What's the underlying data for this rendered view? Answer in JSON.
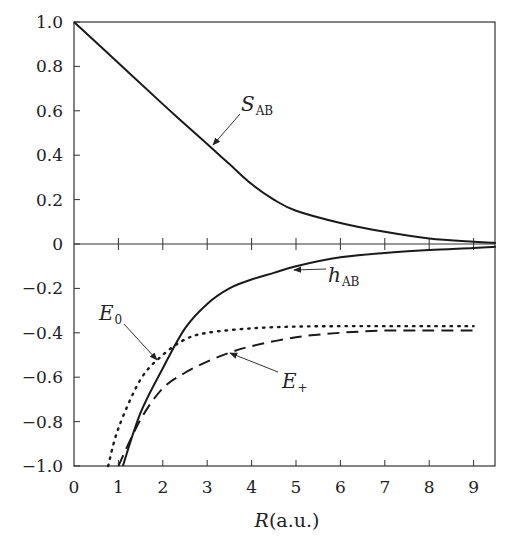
{
  "chart_data": {
    "type": "line",
    "title": "",
    "xlabel": "R(a.u.)",
    "xlabel_italic_part": "R",
    "xlabel_unit_part": "(a.u.)",
    "ylabel": "",
    "xlim": [
      0,
      9.5
    ],
    "ylim": [
      -1.0,
      1.0
    ],
    "grid": false,
    "legend": "inline labels with arrows",
    "x_ticks": [
      0,
      1,
      2,
      3,
      4,
      5,
      6,
      7,
      8,
      9
    ],
    "x_tick_labels": [
      "0",
      "1",
      "2",
      "3",
      "4",
      "5",
      "6",
      "7",
      "8",
      "9"
    ],
    "y_ticks": [
      1.0,
      0.8,
      0.6,
      0.4,
      0.2,
      0,
      -0.2,
      -0.4,
      -0.6,
      -0.8,
      -1.0
    ],
    "y_tick_labels": [
      "1.0",
      "0.8",
      "0.6",
      "0.4",
      "0.2",
      "0",
      "−0.2",
      "−0.4",
      "−0.6",
      "−0.8",
      "−1.0"
    ],
    "zero_line": true,
    "series": [
      {
        "name": "S_AB",
        "label_main": "S",
        "label_sub": "AB",
        "style": "solid",
        "x": [
          0,
          1,
          2,
          3,
          3.5,
          4,
          4.5,
          5,
          6,
          7,
          8,
          9,
          9.5
        ],
        "y": [
          1.0,
          0.815,
          0.63,
          0.45,
          0.36,
          0.27,
          0.2,
          0.15,
          0.095,
          0.055,
          0.025,
          0.01,
          0.005
        ]
      },
      {
        "name": "h_AB",
        "label_main": "h",
        "label_sub": "AB",
        "style": "solid",
        "x": [
          1.1,
          1.5,
          2,
          2.5,
          3,
          3.5,
          4,
          4.5,
          5,
          6,
          7,
          8,
          9,
          9.5
        ],
        "y": [
          -1.0,
          -0.76,
          -0.56,
          -0.38,
          -0.27,
          -0.2,
          -0.16,
          -0.13,
          -0.1,
          -0.06,
          -0.04,
          -0.027,
          -0.018,
          -0.012
        ]
      },
      {
        "name": "E_0",
        "label_main": "E",
        "label_sub": "0",
        "style": "dotted",
        "x": [
          0.77,
          1,
          1.5,
          2,
          2.5,
          3,
          4,
          5,
          6,
          7,
          8,
          9
        ],
        "y": [
          -1.0,
          -0.83,
          -0.61,
          -0.5,
          -0.43,
          -0.4,
          -0.38,
          -0.372,
          -0.37,
          -0.37,
          -0.37,
          -0.37
        ]
      },
      {
        "name": "E_+",
        "label_main": "E",
        "label_sub": "+",
        "style": "dashed",
        "x": [
          1.0,
          1.5,
          2,
          2.5,
          3,
          3.5,
          4,
          5,
          6,
          7,
          8,
          9
        ],
        "y": [
          -1.0,
          -0.79,
          -0.65,
          -0.58,
          -0.53,
          -0.49,
          -0.46,
          -0.42,
          -0.4,
          -0.39,
          -0.39,
          -0.39
        ]
      }
    ],
    "annotations": [
      {
        "text": "S_AB",
        "arrow_to": [
          3.1,
          0.44
        ]
      },
      {
        "text": "h_AB",
        "arrow_to": [
          5.2,
          -0.12
        ]
      },
      {
        "text": "E_0",
        "arrow_to": [
          1.9,
          -0.52
        ]
      },
      {
        "text": "E_+",
        "arrow_to": [
          3.5,
          -0.49
        ]
      }
    ]
  }
}
